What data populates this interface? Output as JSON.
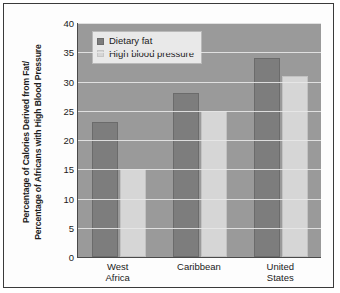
{
  "chart_data": {
    "type": "bar",
    "title": "",
    "xlabel": "",
    "ylabel_lines": [
      "Percentage of Calories Derived from Fat/",
      "Percentage of Africans with High Blood Pressure"
    ],
    "categories": [
      {
        "lines": [
          "West",
          "Africa"
        ]
      },
      {
        "lines": [
          "Caribbean"
        ]
      },
      {
        "lines": [
          "United",
          "States"
        ]
      }
    ],
    "series": [
      {
        "name": "Dietary fat",
        "color": "#7d7d7d",
        "values": [
          23,
          28,
          34
        ]
      },
      {
        "name": "High blood pressure",
        "color": "#d6d6d6",
        "values": [
          15,
          25,
          31
        ]
      }
    ],
    "ylim": [
      0,
      40
    ],
    "ytick_step": 5,
    "yticks": [
      40,
      35,
      30,
      25,
      20,
      15,
      10,
      5,
      0
    ],
    "grid": true,
    "legend_position": "top-left-inside",
    "plot_background": "#9a9a9a",
    "gridline_color": "#e8e8e8"
  }
}
